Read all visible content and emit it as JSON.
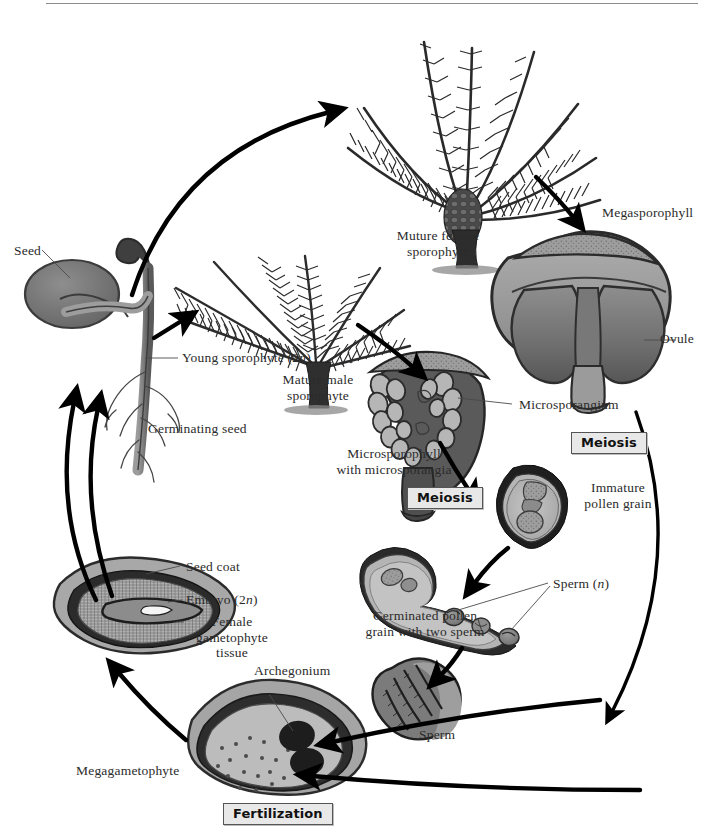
{
  "figure": {
    "style": "grayscale textbook diagram"
  },
  "labels": {
    "seed": "Seed",
    "young_sporophyte": "Young sporophyte (2n)",
    "young_sporophyte_plain": "Young sporophyte (2",
    "young_sporophyte_italic": "n",
    "young_sporophyte_tail": ")",
    "germinating_seed": "Germinating seed",
    "mature_female_sporophyte": "Muture female\nsporophyte",
    "mature_female_sporophyte_l1": "Muture female",
    "mature_female_sporophyte_l2": "sporophyte",
    "mature_male_sporophyte_l1": "Mature male",
    "mature_male_sporophyte_l2": "sporophyte",
    "megasporophyll": "Megasporophyll",
    "ovule": "Ovule",
    "microsporangium": "Microsporangium",
    "microsporophyll_l1": "Microsporophyll",
    "microsporophyll_l2": "with microsporangia",
    "immature_pollen_l1": "Immature",
    "immature_pollen_l2": "pollen grain",
    "sperm_n_plain": "Sperm (",
    "sperm_n_italic": "n",
    "sperm_n_tail": ")",
    "germinated_pollen_l1": "Germinated pollen",
    "germinated_pollen_l2": "grain with two sperm",
    "sperm": "Sperm",
    "archegonium": "Archegonium",
    "megagametophyte": "Megagametophyte",
    "seed_coat": "Seed coat",
    "embryo_plain": "Embryo (2",
    "embryo_italic": "n",
    "embryo_tail": ")",
    "female_gametophyte_l1": "Female",
    "female_gametophyte_l2": "gametophyte",
    "female_gametophyte_l3": "tissue"
  },
  "phase_boxes": {
    "meiosis_right": "Meiosis",
    "meiosis_left": "Meiosis",
    "fertilization": "Fertilization"
  },
  "colors": {
    "page_background": "#ffffff",
    "ink": "#000000",
    "label_text": "#2b2b2b",
    "phase_box_fill": "#e8e8e8",
    "phase_box_border": "#555555",
    "leader_line": "#4b4b4b",
    "tissue_light": "#b9b9b9",
    "tissue_mid": "#8f8f8f",
    "tissue_dark": "#5e5e5e",
    "tissue_darkest": "#3a3a3a",
    "seed_coat_outer": "#9a9a9a",
    "foliage": "#2a2a2a"
  },
  "structures": [
    {
      "name": "seed",
      "stage": "seed"
    },
    {
      "name": "germinating-seed",
      "stage": "germination"
    },
    {
      "name": "mature-male-sporophyte",
      "stage": "sporophyte"
    },
    {
      "name": "mature-female-sporophyte",
      "stage": "sporophyte"
    },
    {
      "name": "megasporophyll-with-ovules",
      "stage": "megasporangiate"
    },
    {
      "name": "microsporophyll-with-microsporangia",
      "stage": "microsporangiate"
    },
    {
      "name": "immature-pollen-grain",
      "stage": "gametophyte"
    },
    {
      "name": "germinated-pollen-grain",
      "stage": "gametophyte"
    },
    {
      "name": "sperm-cell",
      "stage": "gamete"
    },
    {
      "name": "megagametophyte-with-archegonium",
      "stage": "gametophyte"
    },
    {
      "name": "seed-with-embryo",
      "stage": "seed"
    }
  ]
}
